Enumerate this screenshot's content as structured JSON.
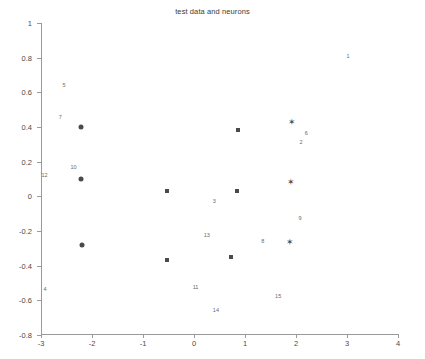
{
  "chart_data": {
    "type": "scatter",
    "title": "test data and neurons",
    "xlabel": "",
    "ylabel": "",
    "xlim": [
      -3,
      4
    ],
    "ylim": [
      -0.8,
      1
    ],
    "grid": false,
    "legend": "none",
    "xticks": [
      "-3",
      "-2",
      "-1",
      "0",
      "1",
      "2",
      "3",
      "4"
    ],
    "xtick_values": [
      -3,
      -2,
      -1,
      0,
      1,
      2,
      3,
      4
    ],
    "yticks": [
      "1",
      "0.8",
      "0.6",
      "0.4",
      "0.2",
      "0",
      "-0.2",
      "-0.4",
      "-0.6",
      "-0.8"
    ],
    "ytick_values": [
      1,
      0.8,
      0.6,
      0.4,
      0.2,
      0,
      -0.2,
      -0.4,
      -0.6,
      -0.8
    ],
    "series": [
      {
        "name": "test data",
        "marker": "square",
        "points": [
          {
            "x": -0.52,
            "y": 0.03
          },
          {
            "x": 0.87,
            "y": 0.385
          },
          {
            "x": 0.85,
            "y": 0.03
          },
          {
            "x": -0.52,
            "y": -0.365
          },
          {
            "x": 0.72,
            "y": -0.35
          }
        ]
      },
      {
        "name": "neurons-circle",
        "marker": "circle",
        "points": [
          {
            "x": -2.22,
            "y": 0.4
          },
          {
            "x": -2.22,
            "y": 0.1
          },
          {
            "x": -2.2,
            "y": -0.28
          }
        ]
      },
      {
        "name": "neurons-star",
        "marker": "star",
        "points": [
          {
            "x": 1.93,
            "y": 0.43
          },
          {
            "x": 1.9,
            "y": 0.08
          },
          {
            "x": 1.88,
            "y": -0.265
          }
        ]
      }
    ],
    "annotations": [
      {
        "label": "1",
        "x": 3.02,
        "y": 0.81
      },
      {
        "label": "5",
        "x": -2.55,
        "y": 0.645
      },
      {
        "label": "7",
        "x": -2.62,
        "y": 0.455
      },
      {
        "label": "6",
        "x": 2.2,
        "y": 0.365
      },
      {
        "label": "2",
        "x": 2.1,
        "y": 0.315
      },
      {
        "label": "10",
        "x": -2.36,
        "y": 0.172
      },
      {
        "label": "12",
        "x": -2.93,
        "y": 0.125
      },
      {
        "label": "3",
        "x": 0.4,
        "y": -0.025
      },
      {
        "label": "9",
        "x": 2.08,
        "y": -0.125
      },
      {
        "label": "13",
        "x": 0.25,
        "y": -0.225
      },
      {
        "label": "8",
        "x": 1.35,
        "y": -0.255
      },
      {
        "label": "4",
        "x": -2.92,
        "y": -0.535
      },
      {
        "label": "11",
        "x": 0.03,
        "y": -0.525
      },
      {
        "label": "15",
        "x": 1.65,
        "y": -0.575
      },
      {
        "label": "14",
        "x": 0.43,
        "y": -0.655
      }
    ]
  }
}
